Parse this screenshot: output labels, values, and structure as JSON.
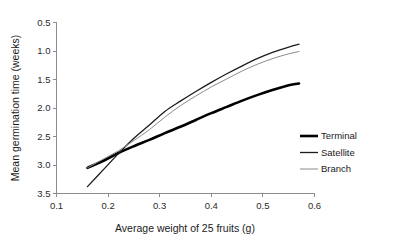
{
  "chart_data": {
    "type": "line",
    "title": "",
    "subtitle": "",
    "xlabel": "Average weight of 25 fruits (g)",
    "ylabel": "Mean germination time (weeks)",
    "xlim": [
      0.1,
      0.6
    ],
    "ylim": [
      0.5,
      3.5
    ],
    "y_axis_inverted": true,
    "grid": false,
    "legend_position": "right-middle",
    "xticks": [
      "0.1",
      "0.2",
      "0.3",
      "0.4",
      "0.5",
      "0.6"
    ],
    "xtick_values": [
      0.1,
      0.2,
      0.3,
      0.4,
      0.5,
      0.6
    ],
    "yticks": [
      "0.5",
      "1.0",
      "1.5",
      "2.0",
      "2.5",
      "3.0",
      "3.5"
    ],
    "ytick_values": [
      0.5,
      1.0,
      1.5,
      2.0,
      2.5,
      3.0,
      3.5
    ],
    "series": [
      {
        "name": "Terminal",
        "color": "#000000",
        "line_width": 2.6,
        "x": [
          0.16,
          0.19,
          0.22,
          0.25,
          0.28,
          0.31,
          0.34,
          0.37,
          0.4,
          0.43,
          0.46,
          0.49,
          0.52,
          0.55,
          0.57
        ],
        "values": [
          3.05,
          2.93,
          2.79,
          2.67,
          2.56,
          2.44,
          2.33,
          2.21,
          2.09,
          1.98,
          1.87,
          1.77,
          1.68,
          1.6,
          1.57
        ]
      },
      {
        "name": "Satellite",
        "color": "#1c1c1c",
        "line_width": 1.3,
        "x": [
          0.16,
          0.19,
          0.22,
          0.25,
          0.28,
          0.31,
          0.34,
          0.37,
          0.4,
          0.43,
          0.46,
          0.49,
          0.52,
          0.55,
          0.57
        ],
        "values": [
          3.38,
          3.09,
          2.8,
          2.53,
          2.3,
          2.06,
          1.88,
          1.71,
          1.55,
          1.4,
          1.26,
          1.13,
          1.02,
          0.93,
          0.88
        ]
      },
      {
        "name": "Branch",
        "color": "#8a8a8a",
        "line_width": 1.0,
        "x": [
          0.16,
          0.19,
          0.22,
          0.25,
          0.28,
          0.31,
          0.34,
          0.37,
          0.4,
          0.43,
          0.46,
          0.49,
          0.52,
          0.55,
          0.57
        ],
        "values": [
          3.05,
          2.9,
          2.75,
          2.57,
          2.38,
          2.16,
          1.96,
          1.79,
          1.63,
          1.49,
          1.35,
          1.23,
          1.13,
          1.05,
          1.01
        ]
      }
    ]
  },
  "legend": {
    "items": [
      {
        "label": "Terminal"
      },
      {
        "label": "Satellite"
      },
      {
        "label": "Branch"
      }
    ]
  },
  "axes": {
    "x_title": "Average weight of 25 fruits (g)",
    "y_title": "Mean germination time (weeks)"
  }
}
